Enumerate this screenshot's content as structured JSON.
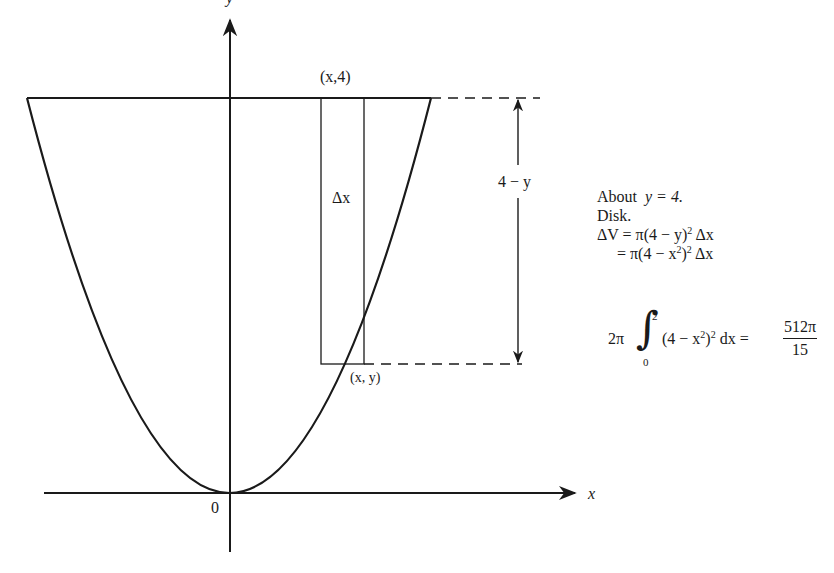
{
  "figure": {
    "axes": {
      "x_label": "x",
      "y_label": "y",
      "origin_label": "0"
    },
    "curve": "y = x^2",
    "line": "y = 4",
    "labels": {
      "top_point": "(x,4)",
      "bottom_point": "(x, y)",
      "strip_width": "Δx",
      "distance": "4 − y"
    }
  },
  "notes": {
    "line1_text": "About",
    "line1_eq": "y = 4.",
    "line2": "Disk.",
    "line3_lhs": "ΔV = π(4 − y)",
    "line3_exp": "2",
    "line3_rhs": " Δx",
    "line4_lhs": "= π(4 − x",
    "line4_exp1": "2",
    "line4_mid": ")",
    "line4_exp2": "2",
    "line4_rhs": " Δx"
  },
  "integral": {
    "coef": "2π",
    "upper": "2",
    "lower": "0",
    "integrand_a": "(4 − x",
    "integrand_exp1": "2",
    "integrand_b": ")",
    "integrand_exp2": "2",
    "integrand_c": " dx =",
    "result_num": "512π",
    "result_den": "15"
  }
}
